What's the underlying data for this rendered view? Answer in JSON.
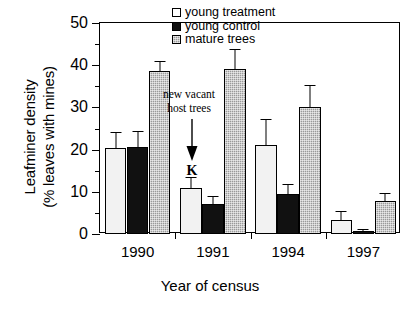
{
  "chart_data": {
    "type": "bar",
    "title": "",
    "xlabel": "Year of census",
    "ylabel_line1": "Leafminer density",
    "ylabel_line2": "(% leaves with mines)",
    "categories": [
      "1990",
      "1991",
      "1994",
      "1997"
    ],
    "ylim": [
      0,
      50
    ],
    "yticks": [
      0,
      10,
      20,
      30,
      40,
      50
    ],
    "ytick_labels": [
      "0",
      "10",
      "20",
      "30",
      "40",
      "50"
    ],
    "minor_tick_step": 5,
    "grid": false,
    "legend_position": "top-right",
    "series": [
      {
        "name": "young treatment",
        "color": "#f2f2f2",
        "values": [
          20.3,
          10.8,
          21.2,
          3.3
        ],
        "errors": [
          3.9,
          2.8,
          6.0,
          2.1
        ]
      },
      {
        "name": "young control",
        "color": "#111111",
        "values": [
          20.7,
          7.2,
          9.5,
          0.8
        ],
        "errors": [
          3.7,
          1.9,
          2.4,
          0.5
        ]
      },
      {
        "name": "mature trees",
        "color": "#9a9a9a",
        "values": [
          38.6,
          39.2,
          30.0,
          7.8
        ],
        "errors": [
          2.5,
          4.6,
          5.2,
          1.8
        ]
      }
    ],
    "annotations": [
      {
        "id": "new-vacant-host-trees",
        "line1": "new vacant",
        "line2": "host trees",
        "marker": "K",
        "arrow": "down-arrow",
        "points_at_category": "1991"
      }
    ]
  },
  "legend": {
    "items": [
      {
        "label": "young treatment",
        "swatch": "young-treatment"
      },
      {
        "label": "young control",
        "swatch": "young-control"
      },
      {
        "label": "mature trees",
        "swatch": "mature-trees"
      }
    ]
  }
}
